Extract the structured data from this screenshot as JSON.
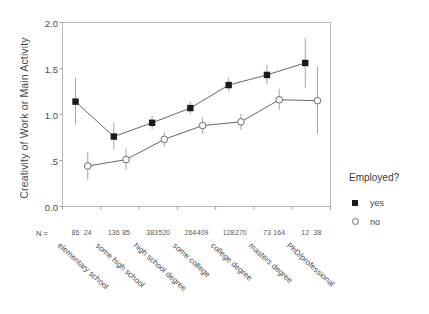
{
  "chart_data": {
    "type": "line",
    "title": "",
    "xlabel": "",
    "ylabel": "Creativity of Work or Main Activity",
    "ylim": [
      0.0,
      2.0
    ],
    "yticks": [
      "0.0",
      ".5",
      "1.0",
      "1.5",
      "2.0"
    ],
    "ytick_values": [
      0.0,
      0.5,
      1.0,
      1.5,
      2.0
    ],
    "grid": false,
    "legend_position": "right",
    "legend_title": "Employed?",
    "categories": [
      "elementary school",
      "some high school",
      "high school degree",
      "some college",
      "college degree",
      "masters degree",
      "PhD/professional"
    ],
    "series": [
      {
        "name": "yes",
        "marker": "filled-square",
        "values": [
          1.14,
          0.76,
          0.91,
          1.07,
          1.32,
          1.43,
          1.56
        ],
        "ci_low": [
          0.89,
          0.62,
          0.84,
          1.01,
          1.25,
          1.33,
          1.29
        ],
        "ci_high": [
          1.4,
          0.91,
          0.99,
          1.14,
          1.4,
          1.54,
          1.83
        ],
        "n": [
          86,
          136,
          383,
          264,
          128,
          73,
          12
        ]
      },
      {
        "name": "no",
        "marker": "open-circle",
        "values": [
          0.44,
          0.51,
          0.73,
          0.88,
          0.92,
          1.16,
          1.15
        ],
        "ci_low": [
          0.29,
          0.4,
          0.65,
          0.79,
          0.83,
          1.05,
          0.79
        ],
        "ci_high": [
          0.59,
          0.63,
          0.81,
          0.97,
          1.01,
          1.28,
          1.52
        ],
        "n": [
          24,
          85,
          520,
          409,
          270,
          164,
          38
        ]
      }
    ],
    "n_row_label": "N =",
    "n_values": [
      86,
      24,
      136,
      85,
      383,
      520,
      264,
      409,
      128,
      270,
      73,
      164,
      12,
      38
    ]
  },
  "legend": {
    "title": "Employed?",
    "items": [
      {
        "label": "yes",
        "marker": "filled-square"
      },
      {
        "label": "no",
        "marker": "open-circle"
      }
    ]
  },
  "axes": {
    "y_title": "Creativity of Work or Main Activity",
    "n_prefix": "N ="
  },
  "colors": {
    "series_yes": "#1b1b1b",
    "series_no": "#ffffff",
    "series_no_stroke": "#6a6a6a",
    "line": "#555555",
    "errorbar": "#999999",
    "frame": "#b8b8b8",
    "text": "#4a4a4a"
  }
}
